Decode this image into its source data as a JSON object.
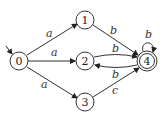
{
  "diagram": {
    "type": "finite-automaton",
    "start_state": "0",
    "accept_states": [
      "4"
    ],
    "states": [
      {
        "id": "0",
        "label": "0",
        "x": 19,
        "y": 61
      },
      {
        "id": "1",
        "label": "1",
        "x": 85,
        "y": 20
      },
      {
        "id": "2",
        "label": "2",
        "x": 85,
        "y": 61
      },
      {
        "id": "3",
        "label": "3",
        "x": 85,
        "y": 102
      },
      {
        "id": "4",
        "label": "4",
        "x": 147,
        "y": 61
      }
    ],
    "transitions": [
      {
        "from": "0",
        "to": "1",
        "label": "a"
      },
      {
        "from": "0",
        "to": "2",
        "label": "a"
      },
      {
        "from": "0",
        "to": "3",
        "label": "a"
      },
      {
        "from": "1",
        "to": "4",
        "label": "b"
      },
      {
        "from": "2",
        "to": "4",
        "label": "b"
      },
      {
        "from": "4",
        "to": "2",
        "label": "b"
      },
      {
        "from": "3",
        "to": "4",
        "label": "c"
      },
      {
        "from": "4",
        "to": "4",
        "label": "b"
      }
    ]
  },
  "labels": {
    "s0": "0",
    "s1": "1",
    "s2": "2",
    "s3": "3",
    "s4": "4",
    "e01": "a",
    "e02": "a",
    "e03": "a",
    "e14": "b",
    "e24": "b",
    "e42": "b",
    "e34": "c",
    "e44": "b"
  }
}
